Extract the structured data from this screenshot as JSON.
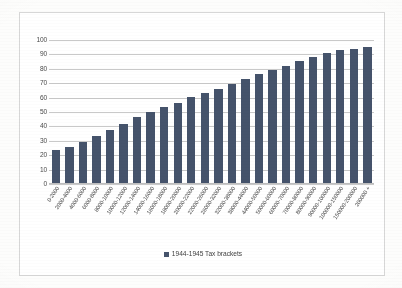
{
  "chart_data": {
    "type": "bar",
    "title": "",
    "xlabel": "",
    "ylabel": "",
    "ylim": [
      0,
      100
    ],
    "yticks": [
      0,
      10,
      20,
      30,
      40,
      50,
      60,
      70,
      80,
      90,
      100
    ],
    "grid": true,
    "legend_position": "bottom",
    "series_color": "#45536B",
    "categories": [
      "0-2000",
      "2000-4000",
      "4000-6000",
      "6000-8000",
      "8000-10000",
      "10000-12000",
      "12000-14000",
      "14000-16000",
      "16000-18000",
      "18000-20000",
      "20000-22000",
      "22000-26000",
      "26000-32000",
      "32000-38000",
      "38000-44000",
      "44000-50000",
      "50000-60000",
      "60000-70000",
      "70000-80000",
      "80000-90000",
      "90000-100000",
      "100000-150000",
      "150000-200000",
      "200000 +"
    ],
    "series": [
      {
        "name": "1944-1945 Tax brackets",
        "values": [
          23,
          25,
          29,
          33,
          37,
          41,
          46,
          50,
          53,
          56,
          60,
          63,
          66,
          69,
          73,
          76,
          79,
          82,
          85,
          88,
          91,
          93,
          94,
          95
        ]
      }
    ]
  },
  "legend": {
    "label": "1944-1945 Tax brackets"
  }
}
